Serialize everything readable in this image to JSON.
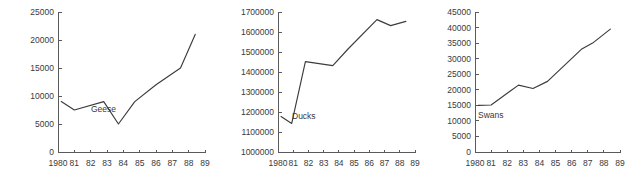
{
  "figure": {
    "background": "#ffffff",
    "line_color": "#3c3c3c",
    "axis_color": "#5a5a5a",
    "text_color": "#3a3a3a"
  },
  "chart_data": [
    {
      "type": "line",
      "title": "",
      "series_label": "Geese",
      "xlabel": "",
      "ylabel": "",
      "grid": false,
      "legend_position": "inline-right-of-line",
      "xlim": [
        1980,
        1989
      ],
      "ylim": [
        0,
        25000
      ],
      "xticks": [
        1980,
        1981,
        1982,
        1983,
        1984,
        1985,
        1986,
        1987,
        1988,
        1989
      ],
      "xtick_labels": [
        "1980",
        "81",
        "82",
        "83",
        "84",
        "85",
        "86",
        "87",
        "88",
        "89"
      ],
      "yticks": [
        0,
        5000,
        10000,
        15000,
        20000,
        25000
      ],
      "ytick_labels": [
        "0",
        "5000",
        "10000",
        "15000",
        "20000",
        "25000"
      ],
      "x": [
        1980.2,
        1981.0,
        1982.8,
        1983.7,
        1984.7,
        1986.0,
        1987.5,
        1988.4
      ],
      "values": [
        9000,
        7500,
        9000,
        5000,
        9000,
        12000,
        15000,
        21000
      ]
    },
    {
      "type": "line",
      "title": "",
      "series_label": "Ducks",
      "xlabel": "",
      "ylabel": "",
      "grid": false,
      "legend_position": "inline-right-of-line",
      "xlim": [
        1980,
        1989
      ],
      "ylim": [
        1000000,
        1700000
      ],
      "xticks": [
        1980,
        1981,
        1982,
        1983,
        1984,
        1985,
        1986,
        1987,
        1988,
        1989
      ],
      "xtick_labels": [
        "1980",
        "81",
        "82",
        "83",
        "84",
        "85",
        "86",
        "87",
        "88",
        "89"
      ],
      "yticks": [
        1000000,
        1100000,
        1200000,
        1300000,
        1400000,
        1500000,
        1600000,
        1700000
      ],
      "ytick_labels": [
        "1000000",
        "1100000",
        "1200000",
        "1300000",
        "1400000",
        "1500000",
        "1600000",
        "1700000"
      ],
      "x": [
        1980.2,
        1980.9,
        1981.8,
        1983.6,
        1984.6,
        1986.5,
        1987.4,
        1988.4
      ],
      "values": [
        1177000,
        1143000,
        1452000,
        1432000,
        1515000,
        1662000,
        1632000,
        1653000
      ]
    },
    {
      "type": "line",
      "title": "",
      "series_label": "Swans",
      "xlabel": "",
      "ylabel": "",
      "grid": false,
      "legend_position": "inline-right-of-line",
      "xlim": [
        1980,
        1989
      ],
      "ylim": [
        0,
        45000
      ],
      "xticks": [
        1980,
        1981,
        1982,
        1983,
        1984,
        1985,
        1986,
        1987,
        1988,
        1989
      ],
      "xtick_labels": [
        "1980",
        "81",
        "82",
        "83",
        "84",
        "85",
        "86",
        "87",
        "88",
        "89"
      ],
      "yticks": [
        0,
        5000,
        10000,
        15000,
        20000,
        25000,
        30000,
        35000,
        40000,
        45000
      ],
      "ytick_labels": [
        "0",
        "5000",
        "10000",
        "15000",
        "20000",
        "25000",
        "30000",
        "35000",
        "40000",
        "45000"
      ],
      "x": [
        1980.2,
        1981.0,
        1982.7,
        1983.6,
        1984.5,
        1986.6,
        1987.3,
        1988.4
      ],
      "values": [
        15000,
        15100,
        21500,
        20400,
        22700,
        33000,
        35000,
        39500
      ]
    }
  ]
}
